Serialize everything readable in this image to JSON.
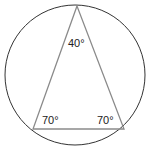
{
  "diagram": {
    "circle": {
      "cx": 75,
      "cy": 75,
      "r": 70,
      "stroke": "#333333"
    },
    "triangle": {
      "stroke": "#8a8a8a",
      "vertices": {
        "apex": {
          "x": 77,
          "y": 6
        },
        "base_left": {
          "x": 33,
          "y": 129
        },
        "base_right": {
          "x": 124,
          "y": 129
        }
      }
    },
    "angles": {
      "apex": "40°",
      "base_left": "70°",
      "base_right": "70°"
    }
  }
}
